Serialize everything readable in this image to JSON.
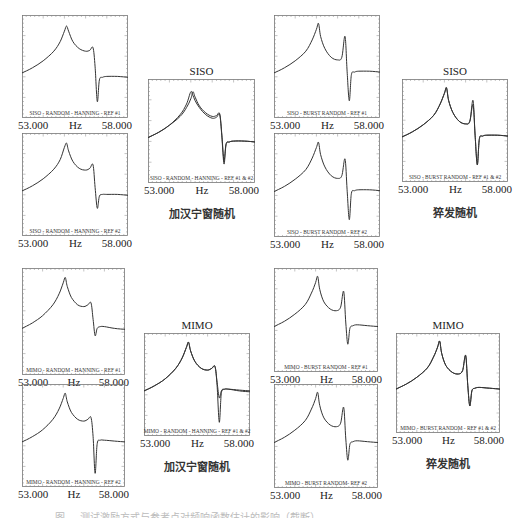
{
  "figure": {
    "caption_partial": "图 … 测试激励方式与参考点对频响函数估计的影响（截断）",
    "groups": [
      {
        "label": "加汉宁窗随机",
        "combined_title": "SISO"
      },
      {
        "label": "猝发随机",
        "combined_title": "SISO"
      },
      {
        "label": "加汉宁窗随机",
        "combined_title": "MIMO"
      },
      {
        "label": "猝发随机",
        "combined_title": "MIMO"
      }
    ]
  },
  "axis": {
    "xmin": "53.000",
    "xmax": "58.000",
    "xlabel": "Hz"
  },
  "panels": [
    {
      "id": "p1",
      "x": 22,
      "y": 15,
      "w": 106,
      "h": 103,
      "legend": "SISO - RANDOM - HANNING - REF #1"
    },
    {
      "id": "p2",
      "x": 22,
      "y": 133,
      "w": 106,
      "h": 103,
      "legend": "SISO - RANDOM - HANNING - REF #2"
    },
    {
      "id": "p3",
      "x": 148,
      "y": 79,
      "w": 107,
      "h": 104,
      "legend": "SISO - RANDOM - HANNING - REF #1 & #2",
      "title": "SISO",
      "caption": "加汉宁窗随机"
    },
    {
      "id": "p4",
      "x": 274,
      "y": 15,
      "w": 106,
      "h": 103,
      "legend": "SISO - BURST RANDOM - REF #1"
    },
    {
      "id": "p5",
      "x": 274,
      "y": 133,
      "w": 106,
      "h": 104,
      "legend": "SISO - BURST RANDOM - REF #2"
    },
    {
      "id": "p6",
      "x": 402,
      "y": 79,
      "w": 106,
      "h": 103,
      "legend": "SISO - BURST RANDOM - REF #1 & #2",
      "title": "SISO",
      "caption": "猝发随机"
    },
    {
      "id": "p7",
      "x": 22,
      "y": 268,
      "w": 103,
      "h": 107,
      "legend": "MIMO - RANDOM - HANNING - REF #1"
    },
    {
      "id": "p8",
      "x": 22,
      "y": 384,
      "w": 103,
      "h": 103,
      "legend": "MIMO - RANDOM - HANNING - REF #2"
    },
    {
      "id": "p9",
      "x": 144,
      "y": 333,
      "w": 106,
      "h": 103,
      "legend": "MIMO - RANDOM - HANNING - REF #1 & #2",
      "title": "MIMO",
      "caption": "加汉宁窗随机"
    },
    {
      "id": "p10",
      "x": 274,
      "y": 268,
      "w": 104,
      "h": 104,
      "legend": "MIMO - BURST RANDOM - REF #1"
    },
    {
      "id": "p11",
      "x": 274,
      "y": 384,
      "w": 104,
      "h": 104,
      "legend": "MIMO - BURST RANDOM- REF #2"
    },
    {
      "id": "p12",
      "x": 396,
      "y": 333,
      "w": 104,
      "h": 100,
      "legend": "MIMO - BURST RANDOM - REF #1 & #2",
      "title": "MIMO",
      "caption": "猝发随机"
    }
  ],
  "chart_data": {
    "type": "line",
    "xlabel": "Hz",
    "ylabel": "",
    "xlim": [
      53.0,
      58.0
    ],
    "x_tick_labels": [
      "53.000",
      "58.000"
    ],
    "grid": false,
    "x": [
      53.0,
      53.5,
      54.0,
      54.5,
      54.8,
      55.0,
      55.1,
      55.2,
      55.4,
      55.7,
      56.0,
      56.2,
      56.35,
      56.45,
      56.55,
      56.65,
      56.8,
      57.0,
      57.5,
      58.0
    ],
    "series": [
      {
        "name": "SISO - RANDOM - HANNING - REF #1",
        "values": [
          0.38,
          0.44,
          0.52,
          0.63,
          0.74,
          0.86,
          0.92,
          0.86,
          0.74,
          0.66,
          0.63,
          0.64,
          0.67,
          0.45,
          0.05,
          0.3,
          0.33,
          0.34,
          0.34,
          0.33
        ]
      },
      {
        "name": "SISO - RANDOM - HANNING - REF #2",
        "values": [
          0.38,
          0.44,
          0.52,
          0.63,
          0.74,
          0.88,
          0.93,
          0.84,
          0.72,
          0.64,
          0.62,
          0.64,
          0.68,
          0.42,
          0.18,
          0.32,
          0.34,
          0.34,
          0.34,
          0.33
        ]
      },
      {
        "name": "SISO - RANDOM - HANNING - REF #1 (overlay)",
        "values": [
          0.38,
          0.44,
          0.52,
          0.64,
          0.76,
          0.9,
          0.86,
          0.8,
          0.72,
          0.64,
          0.6,
          0.61,
          0.64,
          0.4,
          0.08,
          0.3,
          0.33,
          0.34,
          0.34,
          0.33
        ]
      },
      {
        "name": "SISO - RANDOM - HANNING - REF #2 (overlay)",
        "values": [
          0.38,
          0.44,
          0.52,
          0.62,
          0.72,
          0.82,
          0.9,
          0.84,
          0.74,
          0.66,
          0.62,
          0.63,
          0.65,
          0.42,
          0.12,
          0.31,
          0.33,
          0.34,
          0.34,
          0.33
        ]
      },
      {
        "name": "SISO - BURST RANDOM - REF #1",
        "values": [
          0.38,
          0.44,
          0.52,
          0.63,
          0.76,
          0.88,
          0.95,
          0.8,
          0.66,
          0.56,
          0.53,
          0.56,
          0.8,
          0.4,
          0.06,
          0.36,
          0.39,
          0.4,
          0.4,
          0.39
        ]
      },
      {
        "name": "SISO - BURST RANDOM - REF #2",
        "values": [
          0.38,
          0.44,
          0.52,
          0.63,
          0.76,
          0.88,
          0.94,
          0.8,
          0.66,
          0.56,
          0.53,
          0.56,
          0.75,
          0.4,
          0.06,
          0.36,
          0.39,
          0.4,
          0.4,
          0.39
        ]
      },
      {
        "name": "MIMO - RANDOM - HANNING - REF #1",
        "values": [
          0.38,
          0.44,
          0.52,
          0.64,
          0.76,
          0.88,
          0.94,
          0.84,
          0.72,
          0.64,
          0.62,
          0.64,
          0.66,
          0.48,
          0.3,
          0.38,
          0.4,
          0.4,
          0.38,
          0.37
        ]
      },
      {
        "name": "MIMO - RANDOM - HANNING - REF #2",
        "values": [
          0.38,
          0.44,
          0.52,
          0.64,
          0.76,
          0.88,
          0.94,
          0.84,
          0.72,
          0.64,
          0.62,
          0.64,
          0.66,
          0.44,
          0.02,
          0.36,
          0.4,
          0.4,
          0.39,
          0.38
        ]
      },
      {
        "name": "MIMO - BURST RANDOM - REF #1",
        "values": [
          0.38,
          0.44,
          0.52,
          0.63,
          0.76,
          0.88,
          0.95,
          0.8,
          0.66,
          0.58,
          0.56,
          0.6,
          0.78,
          0.42,
          0.18,
          0.36,
          0.39,
          0.4,
          0.39,
          0.38
        ]
      },
      {
        "name": "MIMO - BURST RANDOM - REF #2",
        "values": [
          0.38,
          0.44,
          0.52,
          0.63,
          0.76,
          0.88,
          0.95,
          0.8,
          0.66,
          0.58,
          0.56,
          0.6,
          0.78,
          0.42,
          0.18,
          0.36,
          0.39,
          0.4,
          0.39,
          0.38
        ]
      }
    ],
    "panel_series": {
      "p1": [
        0
      ],
      "p2": [
        1
      ],
      "p3": [
        2,
        3
      ],
      "p4": [
        4
      ],
      "p5": [
        5
      ],
      "p6": [
        4,
        5
      ],
      "p7": [
        6
      ],
      "p8": [
        7
      ],
      "p9": [
        6,
        7
      ],
      "p10": [
        8
      ],
      "p11": [
        9
      ],
      "p12": [
        8,
        9
      ]
    }
  }
}
